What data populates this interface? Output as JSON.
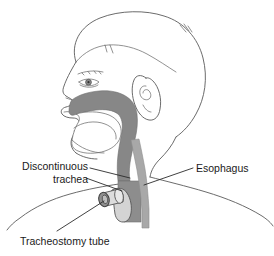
{
  "figure": {
    "background_color": "#ffffff",
    "line_color": "#5a5a5a",
    "label_color": "#1a1a1a"
  },
  "labels": {
    "discontinuous_trachea": {
      "line1": "Discontinuous",
      "line2": "trachea"
    },
    "esophagus": "Esophagus",
    "tracheostomy_tube": "Tracheostomy tube"
  },
  "anatomy": {
    "pharynx_airway": {
      "name": "nasal and pharyngeal airway",
      "fill": "#878787"
    },
    "esophagus_tube": {
      "name": "esophagus",
      "fill": "#a8a8a8"
    },
    "trachea_stump": {
      "name": "discontinuous trachea stump",
      "fill": "#8d8d8d"
    },
    "tube_body": {
      "name": "tracheostomy tube body",
      "fill": "#d4d4d4"
    },
    "tube_rim": {
      "name": "tracheostomy tube outer rim",
      "fill": "#8f8f8f"
    },
    "head_outline": {
      "name": "child head profile outline",
      "stroke": "#5a5a5a"
    }
  }
}
